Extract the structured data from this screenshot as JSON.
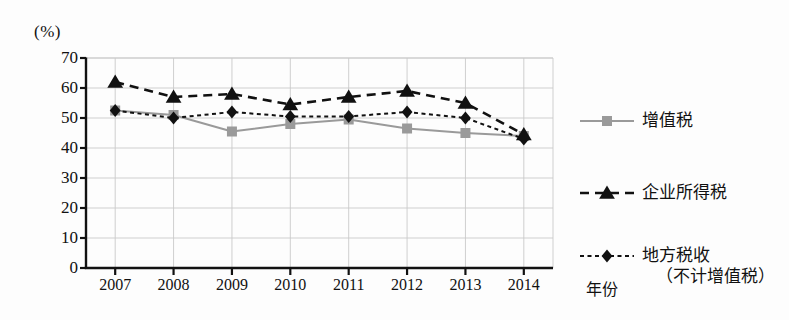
{
  "chart_data": {
    "type": "line",
    "title": "",
    "xlabel": "年份",
    "ylabel": "(%)",
    "unit_label": "(%)",
    "categories": [
      "2007",
      "2008",
      "2009",
      "2010",
      "2011",
      "2012",
      "2013",
      "2014"
    ],
    "x": [
      2007,
      2008,
      2009,
      2010,
      2011,
      2012,
      2013,
      2014
    ],
    "ylim": [
      0,
      70
    ],
    "ytick_values": [
      0,
      10,
      20,
      30,
      40,
      50,
      60,
      70
    ],
    "ytick_labels": [
      "0",
      "10",
      "20",
      "30",
      "40",
      "50",
      "60",
      "70"
    ],
    "grid": true,
    "legend_position": "right",
    "series": [
      {
        "name": "增值税",
        "name_line2": "",
        "marker": "square",
        "line_style": "solid",
        "color": "#9a9a9a",
        "marker_color": "#9a9a9a",
        "values": [
          52.5,
          51.0,
          45.5,
          48.0,
          49.5,
          46.5,
          45.0,
          44.0
        ]
      },
      {
        "name": "企业所得税",
        "name_line2": "",
        "marker": "triangle",
        "line_style": "dashed",
        "color": "#111111",
        "marker_color": "#111111",
        "values": [
          62.0,
          57.0,
          58.0,
          54.5,
          57.0,
          59.0,
          55.0,
          44.5
        ]
      },
      {
        "name": "地方税收",
        "name_line2": "（不计增值税）",
        "marker": "diamond",
        "line_style": "dotted",
        "color": "#111111",
        "marker_color": "#111111",
        "values": [
          52.5,
          50.0,
          52.0,
          50.5,
          50.5,
          52.0,
          50.0,
          43.0
        ]
      }
    ]
  },
  "axis": {
    "unit": "(%)",
    "x_title": "年份"
  },
  "colors": {
    "vat": "#9a9a9a",
    "corporate": "#111111",
    "local": "#111111",
    "grid": "#c9c9c9",
    "axis": "#111111"
  }
}
